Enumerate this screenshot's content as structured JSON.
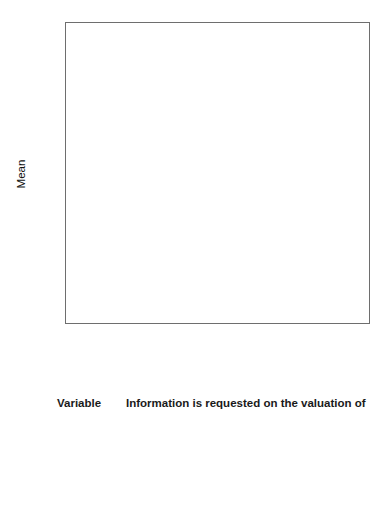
{
  "chart_data": {
    "type": "bar",
    "title": "",
    "xlabel": "",
    "ylabel": "Mean",
    "ylim": [
      0.0,
      1.0
    ],
    "grid": false,
    "legend_position": "none",
    "bar_color": "#8f8f8f",
    "categories": [
      "Patent",
      "Copyrig",
      "Brand",
      "License",
      "Franch",
      "Quota",
      "CustList",
      "TradMark"
    ],
    "values": [
      1.0,
      1.0,
      1.0,
      0.833,
      0.5,
      0.5,
      0.778,
      0.8
    ],
    "data_labels": [
      "1.00",
      "1.00",
      "1.00",
      "0.833",
      "0.50",
      "0.50",
      "0.778",
      "0.80"
    ],
    "y_ticks": [
      0.0,
      0.2,
      0.4,
      0.6,
      0.8,
      1.0
    ],
    "y_tick_labels": [
      "0.0",
      "0.2",
      "0.4",
      "0.6",
      "0.8",
      "1.0"
    ]
  },
  "legend": {
    "headers": [
      "Variable",
      "Information is requested on the valuation of"
    ],
    "rows": [
      {
        "variable": "Patent",
        "description": "Patents"
      },
      {
        "variable": "Copyrig",
        "description": "Copyright"
      },
      {
        "variable": "Brand",
        "description": "Brands"
      },
      {
        "variable": "License",
        "description": "Licences"
      },
      {
        "variable": "Franch",
        "description": "Franchises"
      },
      {
        "variable": "Quota",
        "description": "Quotas"
      },
      {
        "variable": "CustList",
        "description": "Customer lists"
      },
      {
        "variable": "TradMark",
        "description": "Trademarks"
      }
    ]
  }
}
